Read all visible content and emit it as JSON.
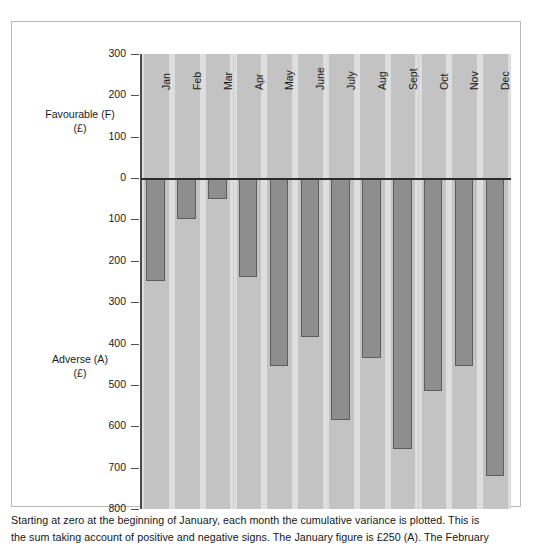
{
  "chart_data": {
    "type": "bar",
    "title": "",
    "xlabel": "",
    "ylabel": "",
    "categories": [
      "Jan",
      "Feb",
      "Mar",
      "Apr",
      "May",
      "June",
      "July",
      "Aug",
      "Sept",
      "Oct",
      "Nov",
      "Dec"
    ],
    "values": [
      -250,
      -100,
      -50,
      -240,
      -455,
      -385,
      -585,
      -435,
      -655,
      -515,
      -455,
      -720
    ],
    "value_unit": "£",
    "orientation": "vertical",
    "grid": false,
    "legend": "none",
    "axis_inverted": true,
    "ylim": [
      -800,
      300
    ],
    "y_ticks": [
      300,
      200,
      100,
      0,
      -100,
      -200,
      -300,
      -400,
      -500,
      -600,
      -700,
      -800
    ],
    "y_tick_labels": [
      "300",
      "200",
      "100",
      "0",
      "100",
      "200",
      "300",
      "400",
      "500",
      "600",
      "700",
      "800"
    ],
    "axis_titles": {
      "positive": "Favourable (F)",
      "positive_unit": "(£)",
      "negative": "Adverse (A)",
      "negative_unit": "(£)"
    },
    "series": [
      {
        "name": "Cumulative variance",
        "values": [
          -250,
          -100,
          -50,
          -240,
          -455,
          -385,
          -585,
          -435,
          -655,
          -515,
          -455,
          -720
        ]
      }
    ],
    "colors": {
      "bar_fill": "#8e8e8e",
      "bar_stroke": "#5d5d5d",
      "plot_band": "#c3c3c3",
      "plot_band_alt": "#dedede",
      "axis": "#4a4a4a",
      "zero_line": "#2b2b2b"
    }
  },
  "caption": {
    "line1": "Starting at zero at the beginning of January, each month the cumulative variance is plotted. This is",
    "line2": "the sum taking account of positive and negative signs. The January figure is £250 (A). The February"
  }
}
